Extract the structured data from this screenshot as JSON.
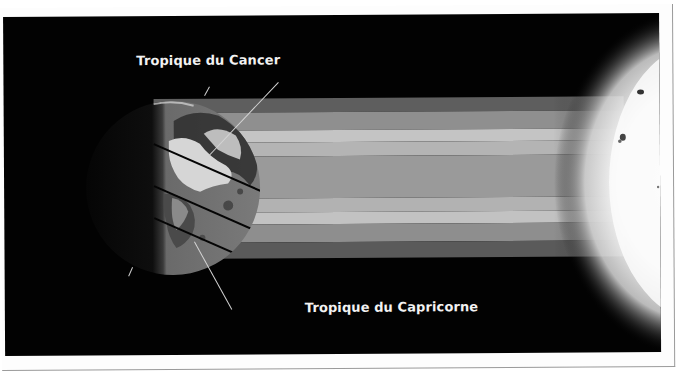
{
  "figure": {
    "title": "",
    "labels": {
      "tropic_cancer": "Tropique du Cancer",
      "tropic_capricorne": "Tropique du Capricorne"
    },
    "elements": {
      "earth": "earth-globe",
      "sun": "sun",
      "light_rays": "sunlight-bands"
    },
    "bands": [
      {
        "name": "outer-top",
        "shade": "#5e5e5e"
      },
      {
        "name": "mid-top",
        "shade": "#8f8f8f"
      },
      {
        "name": "light-top",
        "shade": "#bdbdbd"
      },
      {
        "name": "center",
        "shade": "#9a9a9a"
      },
      {
        "name": "light-bottom",
        "shade": "#bcbcbc"
      },
      {
        "name": "mid-bottom",
        "shade": "#8e8e8e"
      },
      {
        "name": "outer-bottom",
        "shade": "#5a5a5a"
      }
    ],
    "colors": {
      "background": "#020202",
      "label_text": "#f2f2f2",
      "card": "#fdfdfd",
      "card_border": "#9a9a9a"
    }
  }
}
